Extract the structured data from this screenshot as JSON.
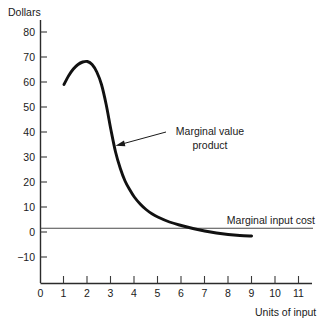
{
  "chart_data": {
    "type": "line",
    "title": "",
    "xlabel": "Units of input",
    "ylabel": "Dollars",
    "xlim": [
      0,
      11.6
    ],
    "ylim": [
      -16,
      86
    ],
    "grid": false,
    "legend_position": "inline-annotations",
    "x_ticks": [
      0,
      1,
      2,
      3,
      4,
      5,
      6,
      7,
      8,
      9,
      10,
      11
    ],
    "x_tick_labels": [
      "0",
      "1",
      "2",
      "3",
      "4",
      "5",
      "6",
      "7",
      "8",
      "9",
      "10",
      "11"
    ],
    "y_ticks": [
      -10,
      0,
      10,
      20,
      30,
      40,
      50,
      60,
      70,
      80
    ],
    "y_tick_labels": [
      "−10",
      "0",
      "10",
      "20",
      "30",
      "40",
      "50",
      "60",
      "70",
      "80"
    ],
    "series": [
      {
        "name": "Marginal value product",
        "annotation": "Marginal value product",
        "x": [
          1.0,
          1.2,
          1.4,
          1.6,
          1.8,
          2.0,
          2.2,
          2.4,
          2.6,
          2.8,
          3.0,
          3.2,
          3.4,
          3.6,
          3.8,
          4.0,
          4.25,
          4.5,
          4.75,
          5.0,
          5.5,
          6.0,
          6.5,
          7.0,
          7.5,
          8.0,
          8.5,
          9.0
        ],
        "values": [
          59.0,
          62.5,
          65.2,
          67.0,
          68.0,
          68.2,
          67.0,
          64.0,
          59.0,
          51.0,
          41.0,
          32.0,
          25.5,
          20.5,
          17.0,
          14.0,
          11.2,
          9.0,
          7.3,
          6.0,
          4.0,
          2.6,
          1.4,
          0.4,
          -0.4,
          -1.0,
          -1.4,
          -1.6
        ]
      },
      {
        "name": "Marginal input cost",
        "annotation": "Marginal input cost",
        "type": "horizontal-line",
        "value": 1.5,
        "x_start": 0,
        "x_end": 11.6
      }
    ]
  },
  "labels": {
    "y_axis_title": "Dollars",
    "x_axis_title": "Units of input",
    "mvp_line1": "Marginal value",
    "mvp_line2": "product",
    "mic": "Marginal input cost"
  },
  "colors": {
    "curve": "#111111",
    "axis": "#2b2b2b",
    "cost_line": "#4a4a4a",
    "text": "#1a1a1a",
    "background": "#ffffff"
  }
}
